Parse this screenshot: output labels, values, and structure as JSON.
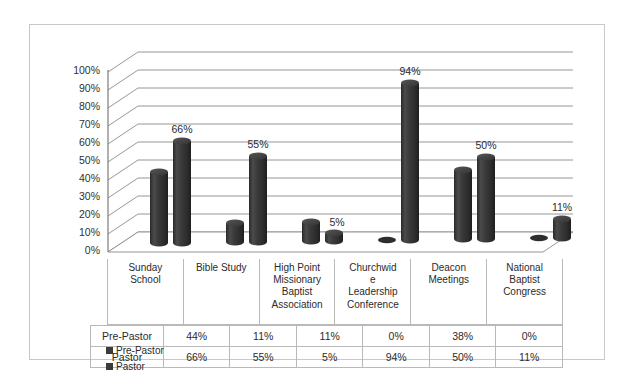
{
  "chart_data": {
    "type": "bar",
    "subtype": "3d-clustered-cylinder",
    "title": "",
    "xlabel": "",
    "ylabel": "",
    "ylim": [
      0,
      100
    ],
    "ytick_labels": [
      "100%",
      "90%",
      "80%",
      "70%",
      "60%",
      "50%",
      "40%",
      "30%",
      "20%",
      "10%",
      "0%"
    ],
    "ytick_values": [
      100,
      90,
      80,
      70,
      60,
      50,
      40,
      30,
      20,
      10,
      0
    ],
    "grid": true,
    "legend_position": "bottom-left",
    "categories": [
      "Sunday School",
      "Bible Study",
      "High Point Missionary Baptist Association",
      "Churchwide Leadership Conference",
      "Deacon Meetings",
      "National Baptist Congress"
    ],
    "series": [
      {
        "name": "Pre-Pastor",
        "values": [
          44,
          11,
          11,
          0,
          38,
          0
        ],
        "labels": [
          "44%",
          "11%",
          "11%",
          "0%",
          "38%",
          "0%"
        ],
        "color": "#3c3c3c",
        "data_labels_shown": false
      },
      {
        "name": "Pastor",
        "values": [
          66,
          55,
          5,
          94,
          50,
          11
        ],
        "labels": [
          "66%",
          "55%",
          "5%",
          "94%",
          "50%",
          "11%"
        ],
        "color": "#3c3c3c",
        "data_labels_shown": true
      }
    ]
  },
  "category_labels": [
    "Sunday School",
    "Bible Study",
    "High Point Missionary Baptist Association",
    "Churchwide Leadership Conference",
    "Deacon Meetings",
    "National Baptist Congress"
  ],
  "category_display": [
    "Sunday\nSchool",
    "Bible Study",
    "High Point\nMissionary\nBaptist\nAssociation",
    "Churchwid\ne\nLeadership\nConference",
    "Deacon\nMeetings",
    "National\nBaptist\nCongress"
  ],
  "legend": {
    "items": [
      {
        "label": "Pre-Pastor",
        "color": "#3c3c3c"
      },
      {
        "label": "Pastor",
        "color": "#3c3c3c"
      }
    ]
  },
  "table": {
    "rows": [
      {
        "header": "Pre-Pastor",
        "values": [
          "44%",
          "11%",
          "11%",
          "0%",
          "38%",
          "0%"
        ]
      },
      {
        "header": "Pastor",
        "values": [
          "66%",
          "55%",
          "5%",
          "94%",
          "50%",
          "11%"
        ]
      }
    ]
  },
  "axis": {
    "ticks": [
      "100%",
      "90%",
      "80%",
      "70%",
      "60%",
      "50%",
      "40%",
      "30%",
      "20%",
      "10%",
      "0%"
    ]
  },
  "data_labels": {
    "pastor": [
      "66%",
      "55%",
      "5%",
      "94%",
      "50%",
      "11%"
    ]
  },
  "colors": {
    "bar": "#3c3c3c",
    "bar_dark": "#262626",
    "bar_light": "#5a5a5a",
    "grid": "#8a8a8a",
    "frame": "#c8c8c8",
    "table_border": "#b9b9b9",
    "text": "#2b2b2b",
    "background": "#ffffff"
  }
}
